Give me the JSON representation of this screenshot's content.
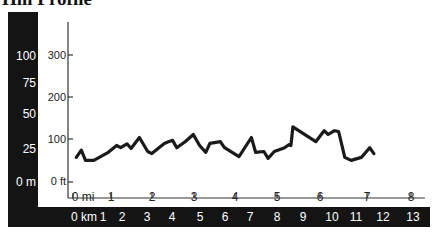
{
  "title": "Hill Profile",
  "colors": {
    "band": "#141414",
    "line": "#1a1a1a",
    "axis": "#333333"
  },
  "axes": {
    "left_meters": [
      {
        "label": "100",
        "y": 49
      },
      {
        "label": "75",
        "y": 76
      },
      {
        "label": "50",
        "y": 107
      },
      {
        "label": "25",
        "y": 142
      },
      {
        "label": "0 m",
        "y": 175
      }
    ],
    "left_feet": [
      {
        "label": "300",
        "y": 49,
        "tick_y": 55
      },
      {
        "label": "200",
        "y": 91,
        "tick_y": 97
      },
      {
        "label": "100",
        "y": 133,
        "tick_y": 139
      },
      {
        "label": "0 ft",
        "y": 175,
        "tick_y": 182
      }
    ],
    "bottom_miles": [
      {
        "label": "0 mi",
        "x": 83,
        "tick_x": 73
      },
      {
        "label": "1",
        "x": 111,
        "tick_x": 111
      },
      {
        "label": "2",
        "x": 152,
        "tick_x": 152
      },
      {
        "label": "3",
        "x": 194,
        "tick_x": 194
      },
      {
        "label": "4",
        "x": 235,
        "tick_x": 235
      },
      {
        "label": "5",
        "x": 277,
        "tick_x": 277
      },
      {
        "label": "6",
        "x": 320,
        "tick_x": 320
      },
      {
        "label": "7",
        "x": 367,
        "tick_x": 367
      },
      {
        "label": "8",
        "x": 411,
        "tick_x": 411
      }
    ],
    "bottom_km": [
      {
        "label": "0 km",
        "x": 84
      },
      {
        "label": "1",
        "x": 103
      },
      {
        "label": "2",
        "x": 122
      },
      {
        "label": "3",
        "x": 147
      },
      {
        "label": "4",
        "x": 172
      },
      {
        "label": "5",
        "x": 200
      },
      {
        "label": "6",
        "x": 225
      },
      {
        "label": "7",
        "x": 250
      },
      {
        "label": "8",
        "x": 277
      },
      {
        "label": "9",
        "x": 303
      },
      {
        "label": "10",
        "x": 332
      },
      {
        "label": "11",
        "x": 356
      },
      {
        "label": "12",
        "x": 383
      },
      {
        "label": "13",
        "x": 413
      }
    ]
  },
  "chart_data": {
    "type": "line",
    "title": "Hill Profile",
    "xlabel": "Distance (mi / km)",
    "ylabel": "Elevation (ft / m)",
    "xlim": [
      0,
      8
    ],
    "ylim": [
      0,
      300
    ],
    "y_secondary_ticks_m": [
      0,
      25,
      50,
      75,
      100
    ],
    "x_secondary_ticks_km": [
      0,
      1,
      2,
      3,
      4,
      5,
      6,
      7,
      8,
      9,
      10,
      11,
      12,
      13
    ],
    "grid": false,
    "series": [
      {
        "name": "Elevation (ft)",
        "x": [
          0.08,
          0.2,
          0.3,
          0.5,
          0.85,
          1.05,
          1.15,
          1.3,
          1.4,
          1.6,
          1.8,
          1.9,
          2.2,
          2.3,
          2.4,
          2.5,
          2.7,
          2.9,
          3.05,
          3.2,
          3.3,
          3.55,
          3.65,
          4.0,
          4.3,
          4.4,
          4.6,
          4.7,
          4.85,
          5.1,
          5.2,
          5.25,
          5.3,
          5.85,
          6.05,
          6.15,
          6.3,
          6.4,
          6.55,
          6.7,
          6.95,
          7.15,
          7.25
        ],
        "values": [
          58,
          75,
          51,
          51,
          70,
          86,
          81,
          90,
          79,
          105,
          72,
          67,
          91,
          95,
          98,
          81,
          95,
          112,
          86,
          70,
          91,
          95,
          81,
          60,
          105,
          70,
          72,
          56,
          72,
          81,
          88,
          86,
          130,
          95,
          121,
          112,
          121,
          119,
          58,
          51,
          58,
          81,
          67
        ]
      }
    ],
    "plot_px": {
      "x0": 73,
      "px_per_mi": 41.5,
      "y0": 182,
      "px_per_ft": 0.424
    }
  }
}
